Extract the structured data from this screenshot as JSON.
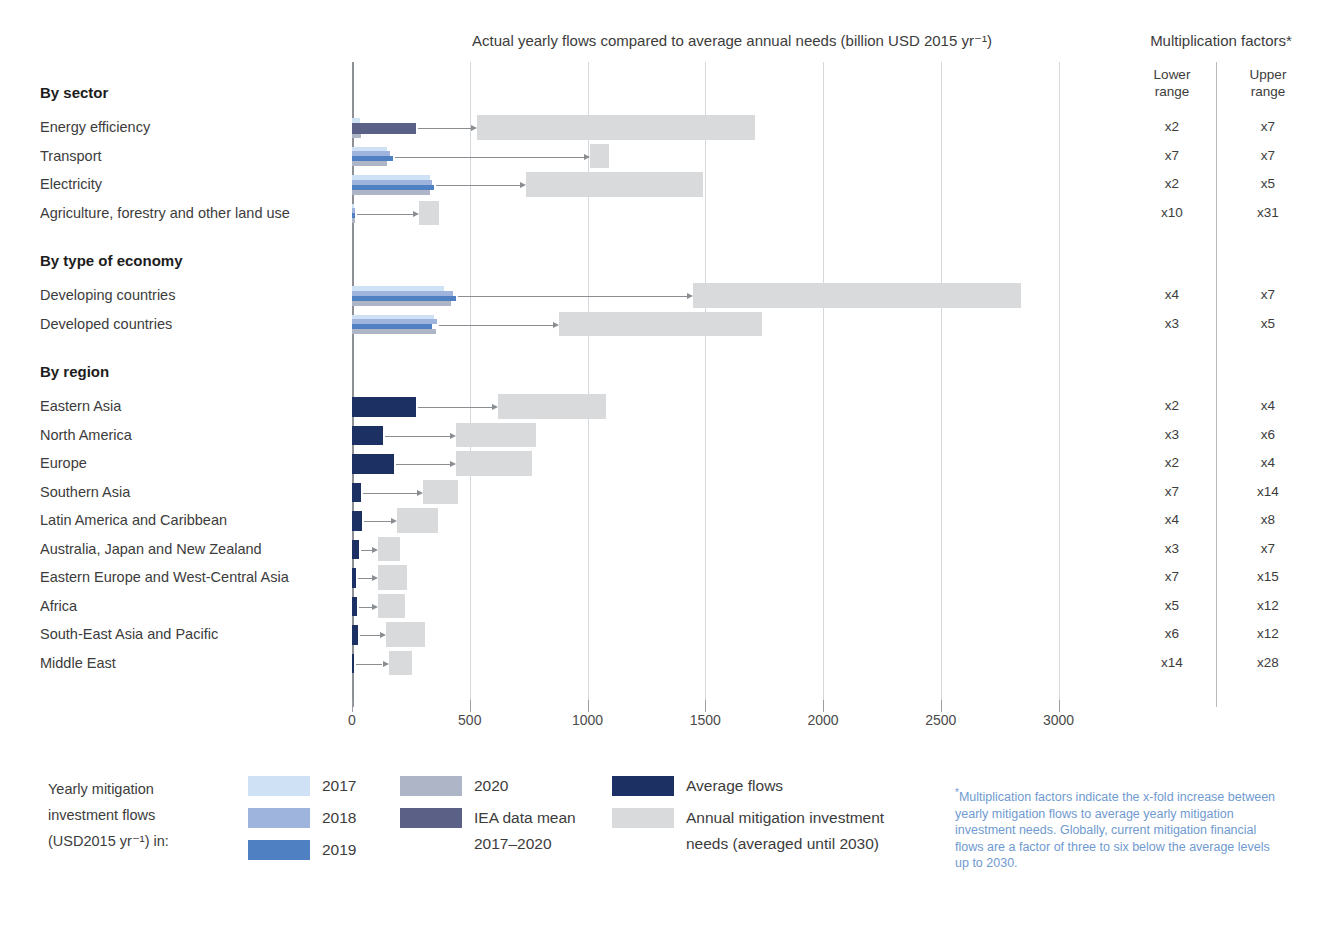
{
  "header": {
    "chart_title": "Actual yearly flows compared to average annual needs (billion USD 2015 yr⁻¹)",
    "factors_title": "Multiplication factors*",
    "factors_lower_header": "Lower range",
    "factors_upper_header": "Upper range"
  },
  "legend": {
    "intro_line1": "Yearly mitigation",
    "intro_line2": "investment flows",
    "intro_line3": "(USD2015 yr⁻¹) in:",
    "items": [
      {
        "label": "2017",
        "color": "#cfe2f5",
        "key": "y2017"
      },
      {
        "label": "2018",
        "color": "#9fb4dd",
        "key": "y2018"
      },
      {
        "label": "2019",
        "color": "#4e80c2",
        "key": "y2019"
      },
      {
        "label": "2020",
        "color": "#adb5c6",
        "key": "y2020"
      },
      {
        "label": "IEA data mean 2017–2020",
        "color": "#5b6186",
        "key": "iea_mean"
      },
      {
        "label": "Average flows",
        "color": "#1d3064",
        "key": "avg_flows"
      },
      {
        "label": "Annual mitigation investment needs (averaged until 2030)",
        "color": "#d8dadc",
        "key": "needs"
      }
    ],
    "iea_label_line1": "IEA data mean",
    "iea_label_line2": "2017–2020",
    "needs_label_line1": "Annual mitigation investment",
    "needs_label_line2": "needs (averaged until 2030)"
  },
  "footnote": {
    "marker": "*",
    "text": "Multiplication factors indicate the x-fold increase between yearly mitigation flows to average yearly mitigation investment needs. Globally, current mitigation financial flows are a factor of three to six below the average levels up to 2030.",
    "color": "#6f9ad0"
  },
  "chart_data": {
    "type": "bar",
    "title": "Actual yearly flows compared to average annual needs (billion USD 2015 yr⁻¹)",
    "xlabel": "billion USD 2015 yr⁻¹",
    "ylabel": "",
    "xlim": [
      0,
      3200
    ],
    "xticks": [
      0,
      500,
      1000,
      1500,
      2000,
      2500,
      3000
    ],
    "xtick_labels": [
      "0",
      "500",
      "1000",
      "1500",
      "2000",
      "2500",
      "3000"
    ],
    "grid": true,
    "legend_position": "bottom",
    "groups": [
      {
        "name": "By sector",
        "rows": [
          {
            "label": "Energy efficiency",
            "y2017": 35,
            "y2018": 38,
            "y2019": 42,
            "y2020": 40,
            "iea_mean": 270,
            "avg_flows": null,
            "needs_from": 530,
            "needs_to": 1710,
            "mf_lower": "x2",
            "mf_upper": "x7"
          },
          {
            "label": "Transport",
            "y2017": 150,
            "y2018": 160,
            "y2019": 175,
            "y2020": 150,
            "iea_mean": null,
            "avg_flows": null,
            "needs_from": 1010,
            "needs_to": 1090,
            "mf_lower": "x7",
            "mf_upper": "x7"
          },
          {
            "label": "Electricity",
            "y2017": 330,
            "y2018": 340,
            "y2019": 350,
            "y2020": 330,
            "iea_mean": null,
            "avg_flows": null,
            "needs_from": 740,
            "needs_to": 1490,
            "mf_lower": "x2",
            "mf_upper": "x5"
          },
          {
            "label": "Agriculture, forestry and other land use",
            "y2017": 10,
            "y2018": 11,
            "y2019": 12,
            "y2020": 11,
            "iea_mean": null,
            "avg_flows": null,
            "needs_from": 285,
            "needs_to": 370,
            "mf_lower": "x10",
            "mf_upper": "x31"
          }
        ]
      },
      {
        "name": "By type of economy",
        "rows": [
          {
            "label": "Developing countries",
            "y2017": 390,
            "y2018": 430,
            "y2019": 440,
            "y2020": 420,
            "iea_mean": null,
            "avg_flows": null,
            "needs_from": 1450,
            "needs_to": 2840,
            "mf_lower": "x4",
            "mf_upper": "x7"
          },
          {
            "label": "Developed countries",
            "y2017": 350,
            "y2018": 360,
            "y2019": 340,
            "y2020": 355,
            "iea_mean": null,
            "avg_flows": null,
            "needs_from": 880,
            "needs_to": 1740,
            "mf_lower": "x3",
            "mf_upper": "x5"
          }
        ]
      },
      {
        "name": "By region",
        "rows": [
          {
            "label": "Eastern Asia",
            "avg_flows": 270,
            "needs_from": 620,
            "needs_to": 1080,
            "mf_lower": "x2",
            "mf_upper": "x4"
          },
          {
            "label": "North America",
            "avg_flows": 130,
            "needs_from": 440,
            "needs_to": 780,
            "mf_lower": "x3",
            "mf_upper": "x6"
          },
          {
            "label": "Europe",
            "avg_flows": 180,
            "needs_from": 440,
            "needs_to": 765,
            "mf_lower": "x2",
            "mf_upper": "x4"
          },
          {
            "label": "Southern Asia",
            "avg_flows": 40,
            "needs_from": 300,
            "needs_to": 450,
            "mf_lower": "x7",
            "mf_upper": "x14"
          },
          {
            "label": "Latin America and Caribbean",
            "avg_flows": 42,
            "needs_from": 190,
            "needs_to": 365,
            "mf_lower": "x4",
            "mf_upper": "x8"
          },
          {
            "label": "Australia, Japan and New Zealand",
            "avg_flows": 30,
            "needs_from": 110,
            "needs_to": 205,
            "mf_lower": "x3",
            "mf_upper": "x7"
          },
          {
            "label": "Eastern Europe and West-Central Asia",
            "avg_flows": 16,
            "needs_from": 110,
            "needs_to": 235,
            "mf_lower": "x7",
            "mf_upper": "x15"
          },
          {
            "label": "Africa",
            "avg_flows": 22,
            "needs_from": 110,
            "needs_to": 225,
            "mf_lower": "x5",
            "mf_upper": "x12"
          },
          {
            "label": "South-East Asia and Pacific",
            "avg_flows": 26,
            "needs_from": 145,
            "needs_to": 310,
            "mf_lower": "x6",
            "mf_upper": "x12"
          },
          {
            "label": "Middle East",
            "avg_flows": 10,
            "needs_from": 155,
            "needs_to": 255,
            "mf_lower": "x14",
            "mf_upper": "x28"
          }
        ]
      }
    ]
  }
}
